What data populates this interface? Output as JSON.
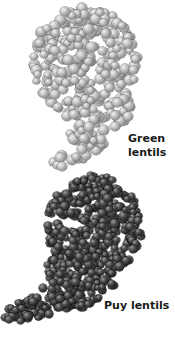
{
  "figure": {
    "items": [
      {
        "name": "green-lentils",
        "label_line1": "Green",
        "label_line2": "lentils",
        "color": "#b0b0b0"
      },
      {
        "name": "puy-lentils",
        "label": "Puy lentils",
        "color": "#2e2e2e"
      }
    ]
  }
}
